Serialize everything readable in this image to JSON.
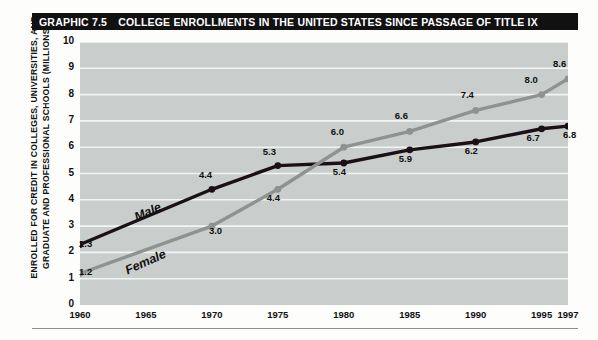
{
  "header": {
    "graphic_number": "GRAPHIC 7.5",
    "title": "COLLEGE ENROLLMENTS IN THE UNITED STATES SINCE PASSAGE OF TITLE IX"
  },
  "axis": {
    "ylabel_line1": "ENROLLED FOR CREDIT IN COLLEGES, UNIVERSITIES, AND",
    "ylabel_line2": "GRADUATE AND PROFESSIONAL SCHOOLS (MILLIONS)"
  },
  "colors": {
    "male_line": "#1b1016",
    "female_line": "#8f9290",
    "plot_background": "#c9cecd",
    "gridline": "#f2f4f3",
    "title_bar": "#111111"
  },
  "chart_data": {
    "type": "line",
    "title": "COLLEGE ENROLLMENTS IN THE UNITED STATES SINCE PASSAGE OF TITLE IX",
    "xlabel": "",
    "ylabel": "ENROLLED FOR CREDIT IN COLLEGES, UNIVERSITIES, AND GRADUATE AND PROFESSIONAL SCHOOLS (MILLIONS)",
    "x": [
      1960,
      1970,
      1975,
      1980,
      1985,
      1990,
      1995,
      1997
    ],
    "xticks": [
      "1960",
      "1965",
      "1970",
      "1975",
      "1980",
      "1985",
      "1990",
      "1995",
      "1997"
    ],
    "xtick_values": [
      1960,
      1965,
      1970,
      1975,
      1980,
      1985,
      1990,
      1995,
      1997
    ],
    "yticks": [
      "0",
      "1",
      "2",
      "3",
      "4",
      "5",
      "6",
      "7",
      "8",
      "9",
      "10"
    ],
    "ytick_values": [
      0,
      1,
      2,
      3,
      4,
      5,
      6,
      7,
      8,
      9,
      10
    ],
    "xlim": [
      1960,
      1997
    ],
    "ylim": [
      0,
      10
    ],
    "grid": true,
    "legend_position": "inline-series-labels",
    "series": [
      {
        "name": "Male",
        "color": "#1b1016",
        "values": [
          2.3,
          4.4,
          5.3,
          5.4,
          5.9,
          6.2,
          6.7,
          6.8
        ],
        "labels": [
          "2.3",
          "4.4",
          "5.3",
          "5.4",
          "5.9",
          "6.2",
          "6.7",
          "6.8"
        ]
      },
      {
        "name": "Female",
        "color": "#8f9290",
        "values": [
          1.2,
          3.0,
          4.4,
          6.0,
          6.6,
          7.4,
          8.0,
          8.6
        ],
        "labels": [
          "1.2",
          "3.0",
          "4.4",
          "6.0",
          "6.6",
          "7.4",
          "8.0",
          "8.6"
        ]
      }
    ]
  }
}
